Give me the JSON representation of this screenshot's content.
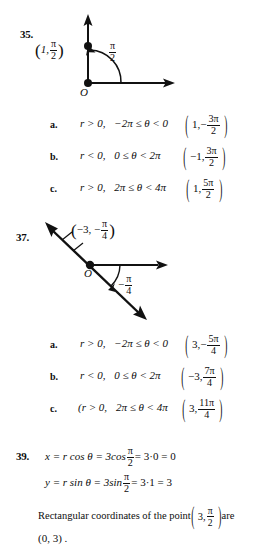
{
  "page": {
    "width": 268,
    "height": 558,
    "background": "#ffffff",
    "ink": "#111111"
  },
  "problems": [
    {
      "number": "35.",
      "figure": {
        "name": "polar-point-figure-35",
        "origin_label": "O",
        "point_label_parts": {
          "open": "(",
          "r": "1,",
          "angle_num": "π",
          "angle_den": "2",
          "close": ")"
        },
        "angle_label": {
          "num": "π",
          "den": "2"
        },
        "description": "vertical ray up and horizontal ray right from origin, point plotted on vertical axis at r=1, arc from positive x-axis counterclockwise to the point"
      },
      "choices": [
        {
          "letter": "a.",
          "condition": {
            "r": "r > 0,",
            "range": "−2π ≤ θ < 0"
          },
          "answer": {
            "r": "1,",
            "sign": "−",
            "num": "3π",
            "den": "2"
          }
        },
        {
          "letter": "b.",
          "condition": {
            "r": "r < 0,",
            "range": "0 ≤ θ < 2π"
          },
          "answer": {
            "r": "−1,",
            "sign": "",
            "num": "3π",
            "den": "2"
          }
        },
        {
          "letter": "c.",
          "condition": {
            "r": "r > 0,",
            "range": "2π ≤ θ < 4π"
          },
          "answer": {
            "r": "1,",
            "sign": "",
            "num": "5π",
            "den": "2"
          }
        }
      ]
    },
    {
      "number": "37.",
      "figure": {
        "name": "polar-point-figure-37",
        "origin_label": "O",
        "point_label_parts": {
          "open": "(",
          "r": "−3, −",
          "angle_num": "π",
          "angle_den": "4",
          "close": ")"
        },
        "angle_label": {
          "sign": "−",
          "num": "π",
          "den": "4"
        },
        "description": "double-headed line through origin at −45°, horizontal ray right from origin, arc below axis to the descending ray, point marked on upper-left ray"
      },
      "choices": [
        {
          "letter": "a.",
          "condition": {
            "r": "r > 0,",
            "range": "−2π ≤ θ < 0"
          },
          "answer": {
            "r": "3,",
            "sign": "−",
            "num": "5π",
            "den": "4"
          }
        },
        {
          "letter": "b.",
          "condition": {
            "r": "r < 0,",
            "range": "0 ≤ θ < 2π"
          },
          "answer": {
            "r": "−3,",
            "sign": "",
            "num": "7π",
            "den": "4"
          }
        },
        {
          "letter": "c.",
          "condition": {
            "r": "(r > 0,",
            "range": "2π ≤ θ < 4π"
          },
          "answer": {
            "r": "3,",
            "sign": "",
            "num": "11π",
            "den": "4"
          }
        }
      ]
    }
  ],
  "problem39": {
    "number": "39.",
    "line1": {
      "lhs": "x = r cos θ = 3cos",
      "frac_num": "π",
      "frac_den": "2",
      "rhs": "= 3·0 = 0"
    },
    "line2": {
      "lhs": "y = r sin θ = 3sin",
      "frac_num": "π",
      "frac_den": "2",
      "rhs": "= 3·1 = 3"
    },
    "line3": {
      "prefix": "Rectangular coordinates of the point",
      "point": {
        "r": "3,",
        "num": "π",
        "den": "2"
      },
      "suffix": "are"
    },
    "line4": "(0, 3) ."
  }
}
